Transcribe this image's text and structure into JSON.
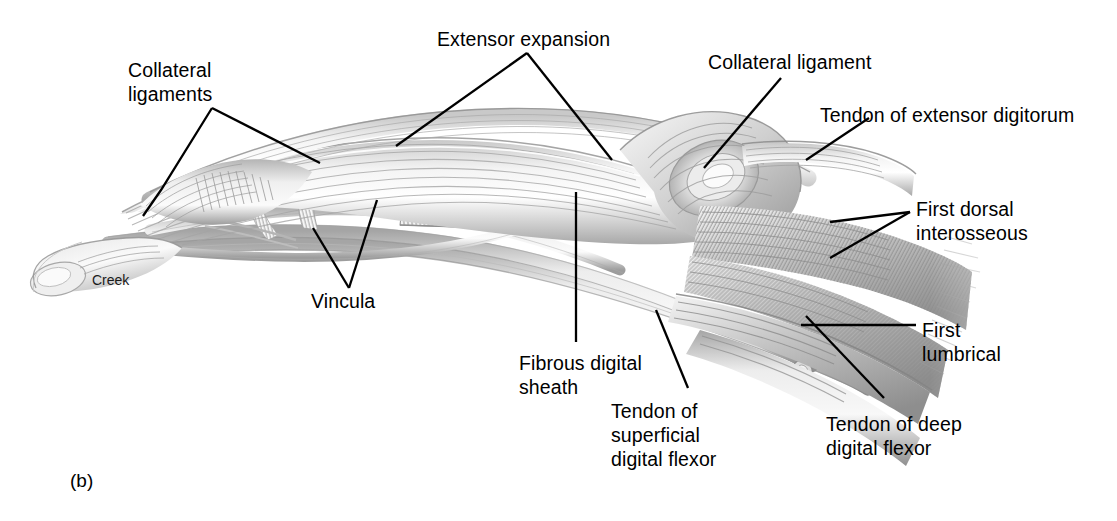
{
  "figure": {
    "caption": "(b)",
    "signature": "Creek",
    "background_color": "#ffffff",
    "ink_color": "#000000",
    "drawing_tone": "#9a9a9a"
  },
  "labels": [
    {
      "id": "collateral-ligaments",
      "text_lines": [
        "Collateral",
        "ligaments"
      ],
      "x": 128,
      "y": 58
    },
    {
      "id": "extensor-expansion",
      "text_lines": [
        "Extensor expansion"
      ],
      "x": 437,
      "y": 27
    },
    {
      "id": "collateral-ligament",
      "text_lines": [
        "Collateral ligament"
      ],
      "x": 708,
      "y": 50
    },
    {
      "id": "tendon-of-extensor-digitorum",
      "text_lines": [
        "Tendon of extensor digitorum"
      ],
      "x": 820,
      "y": 103
    },
    {
      "id": "first-dorsal-interosseous",
      "text_lines": [
        "First dorsal",
        "interosseous"
      ],
      "x": 916,
      "y": 197
    },
    {
      "id": "first-lumbrical",
      "text_lines": [
        "First",
        "lumbrical"
      ],
      "x": 922,
      "y": 318
    },
    {
      "id": "tendon-of-deep-digital-flexor",
      "text_lines": [
        "Tendon of deep",
        "digital flexor"
      ],
      "x": 826,
      "y": 412
    },
    {
      "id": "tendon-of-superficial-digital-flexor",
      "text_lines": [
        "Tendon of",
        "superficial",
        "digital flexor"
      ],
      "x": 611,
      "y": 399
    },
    {
      "id": "fibrous-digital-sheath",
      "text_lines": [
        "Fibrous digital",
        "sheath"
      ],
      "x": 519,
      "y": 351
    },
    {
      "id": "vincula",
      "text_lines": [
        "Vincula"
      ],
      "x": 311,
      "y": 289
    }
  ],
  "leader_lines": [
    {
      "id": "collateral-ligaments-left",
      "points": "212,108 161,190 143,216"
    },
    {
      "id": "collateral-ligaments-right",
      "points": "212,108 320,163"
    },
    {
      "id": "extensor-expansion-left",
      "points": "527,53 396,146"
    },
    {
      "id": "extensor-expansion-right",
      "points": "527,53 612,160"
    },
    {
      "id": "collateral-ligament",
      "points": "781,78 704,168"
    },
    {
      "id": "tendon-of-extensor-digitorum",
      "points": "869,118 806,160"
    },
    {
      "id": "first-dorsal-interosseous-upper",
      "points": "910,212 830,222"
    },
    {
      "id": "first-dorsal-interosseous-lower",
      "points": "910,212 830,258"
    },
    {
      "id": "first-lumbrical",
      "points": "916,325 801,325"
    },
    {
      "id": "tendon-of-deep-digital-flexor",
      "points": "884,398 806,316"
    },
    {
      "id": "tendon-of-superficial-digital-flexor",
      "points": "688,388 656,310"
    },
    {
      "id": "fibrous-digital-sheath",
      "points": "576,342 576,192"
    },
    {
      "id": "vincula-left",
      "points": "349,288 313,228"
    },
    {
      "id": "vincula-right",
      "points": "349,288 377,200"
    }
  ]
}
